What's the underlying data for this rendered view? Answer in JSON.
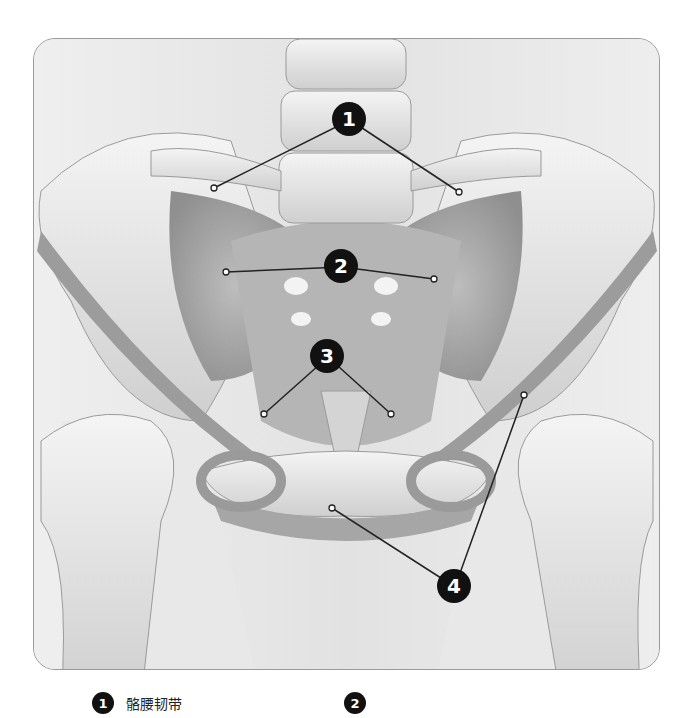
{
  "figure": {
    "colors": {
      "background": "#ececec",
      "bone": "#e4e4e4",
      "ligament": "#9e9e9e",
      "marker": "#111111",
      "marker_text": "#ffffff",
      "frame_border": "#9a9a9a"
    }
  },
  "markers": [
    {
      "number": "1",
      "x": 349,
      "y": 119,
      "targets": [
        [
          213,
          187
        ],
        [
          458,
          191
        ]
      ]
    },
    {
      "number": "2",
      "x": 341,
      "y": 266,
      "targets": [
        [
          225,
          271
        ],
        [
          433,
          278
        ]
      ]
    },
    {
      "number": "3",
      "x": 327,
      "y": 356,
      "targets": [
        [
          263,
          413
        ],
        [
          390,
          413
        ]
      ]
    },
    {
      "number": "4",
      "x": 454,
      "y": 586,
      "targets": [
        [
          331,
          507
        ],
        [
          523,
          394
        ]
      ]
    }
  ],
  "legend": {
    "items": [
      {
        "number": "1",
        "label": "骼腰韧带"
      },
      {
        "number": "2",
        "label": ""
      }
    ]
  }
}
